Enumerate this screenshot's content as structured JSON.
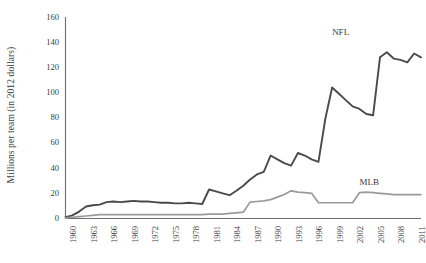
{
  "chart_data": {
    "type": "line",
    "title": "",
    "xlabel": "",
    "ylabel": "Millions per team (in 2012 dollars)",
    "ylim": [
      0,
      160
    ],
    "ytick_step": 20,
    "yticks": [
      0,
      20,
      40,
      60,
      80,
      100,
      120,
      140,
      160
    ],
    "xlim": [
      1960,
      2012
    ],
    "xticks": [
      1960,
      1963,
      1966,
      1969,
      1972,
      1975,
      1978,
      1981,
      1984,
      1987,
      1990,
      1993,
      1996,
      1999,
      2002,
      2005,
      2008,
      2011
    ],
    "grid": false,
    "legend_position": "inline-right",
    "x": [
      1960,
      1961,
      1962,
      1963,
      1964,
      1965,
      1966,
      1967,
      1968,
      1969,
      1970,
      1971,
      1972,
      1973,
      1974,
      1975,
      1976,
      1977,
      1978,
      1979,
      1980,
      1981,
      1982,
      1983,
      1984,
      1985,
      1986,
      1987,
      1988,
      1989,
      1990,
      1991,
      1992,
      1993,
      1994,
      1995,
      1996,
      1997,
      1998,
      1999,
      2000,
      2001,
      2002,
      2003,
      2004,
      2005,
      2006,
      2007,
      2008,
      2009,
      2010,
      2011,
      2012
    ],
    "series": [
      {
        "name": "NFL",
        "color": "#4a4a4a",
        "label_x": 1999,
        "label_y": 148,
        "values": [
          1.0,
          2.5,
          5.5,
          9.5,
          10.5,
          11.0,
          13.0,
          13.5,
          13.0,
          13.5,
          14.0,
          13.5,
          13.5,
          13.0,
          12.5,
          12.5,
          12.0,
          12.0,
          12.5,
          12.0,
          11.5,
          23.0,
          21.5,
          20.0,
          18.5,
          22.0,
          26.0,
          31.0,
          35.0,
          37.0,
          50.0,
          47.0,
          44.0,
          42.0,
          52.0,
          50.0,
          47.0,
          45.0,
          79.0,
          104.0,
          99.0,
          94.0,
          89.0,
          87.0,
          83.0,
          82.0,
          128.0,
          132.0,
          127.0,
          126.0,
          124.0,
          131.0,
          128.0
        ]
      },
      {
        "name": "MLB",
        "color": "#9a9a9a",
        "label_x": 2003,
        "label_y": 29,
        "values": [
          0.5,
          1.0,
          1.5,
          2.0,
          2.5,
          3.0,
          3.0,
          3.0,
          3.0,
          3.0,
          3.0,
          3.0,
          3.0,
          3.0,
          3.0,
          3.0,
          3.0,
          3.0,
          3.0,
          3.0,
          3.0,
          3.5,
          3.5,
          3.5,
          4.0,
          4.5,
          5.0,
          13.0,
          13.5,
          14.0,
          15.0,
          17.0,
          19.0,
          22.0,
          21.0,
          20.5,
          20.0,
          12.5,
          12.5,
          12.5,
          12.5,
          12.5,
          12.5,
          20.5,
          21.0,
          20.5,
          20.0,
          19.5,
          19.0,
          19.0,
          19.0,
          19.0,
          19.0
        ]
      }
    ]
  },
  "axes": {
    "y_title": "Millions per team (in 2012 dollars)",
    "y_tick_labels": [
      "160",
      "140",
      "120",
      "100",
      "80",
      "60",
      "40",
      "20",
      "0"
    ],
    "x_tick_labels": [
      "1960",
      "1963",
      "1966",
      "1969",
      "1972",
      "1975",
      "1978",
      "1981",
      "1984",
      "1987",
      "1990",
      "1993",
      "1996",
      "1999",
      "2002",
      "2005",
      "2008",
      "2011"
    ]
  },
  "series_labels": [
    {
      "text": "NFL",
      "name": "nfl"
    },
    {
      "text": "MLB",
      "name": "mlb"
    }
  ],
  "colors": {
    "nfl_line": "#4a4a4a",
    "mlb_line": "#9a9a9a",
    "axis": "#6e6e6e",
    "text": "#3b3b3b",
    "background": "#ffffff"
  }
}
